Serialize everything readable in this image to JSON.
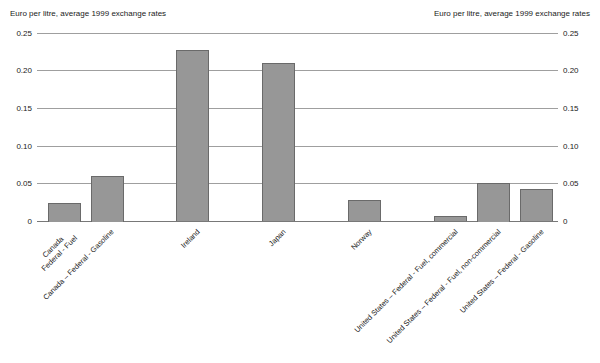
{
  "chart_data": {
    "type": "bar",
    "title_left": "Euro per litre, average 1999 exchange rates",
    "title_right": "Euro per litre, average 1999 exchange rates",
    "ylabel": "Euro per litre",
    "ylim": [
      0,
      0.25
    ],
    "grid": true,
    "legend": "none",
    "yticks": [
      {
        "label": "0.25",
        "value": 0.25
      },
      {
        "label": "0.20",
        "value": 0.2
      },
      {
        "label": "0.15",
        "value": 0.15
      },
      {
        "label": "0.10",
        "value": 0.1
      },
      {
        "label": "0.05",
        "value": 0.05
      },
      {
        "label": "0",
        "value": 0
      }
    ],
    "bars": [
      {
        "label": "Canada\nFederal - Fuel",
        "value": 0.025,
        "slot": 0
      },
      {
        "label": "Canada – Federal - Gasoline",
        "value": 0.061,
        "slot": 1
      },
      {
        "label": "Ireland",
        "value": 0.228,
        "slot": 3
      },
      {
        "label": "Japan",
        "value": 0.21,
        "slot": 5
      },
      {
        "label": "Norway",
        "value": 0.029,
        "slot": 7
      },
      {
        "label": "United States – Federal - Fuel, commercial",
        "value": 0.007,
        "slot": 9
      },
      {
        "label": "United States – Federal - Fuel, non-commercial",
        "value": 0.051,
        "slot": 10
      },
      {
        "label": "United States – Federal - Gasoline",
        "value": 0.043,
        "slot": 11
      }
    ],
    "colors": {
      "bar_fill": "#979797",
      "bar_border": "#6a6a6a",
      "gridline": "#9f9f9f",
      "baseline": "#787878",
      "text": "#1a1a1a",
      "background": "#ffffff"
    }
  }
}
